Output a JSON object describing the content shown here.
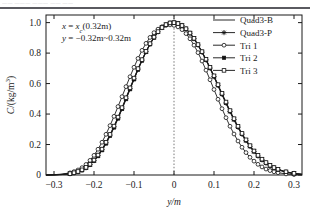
{
  "page": {
    "top_sliver_text": "—— ——— ——— ——  ——",
    "background": "#ffffff",
    "ink": "#1a1a1a"
  },
  "chart_data": {
    "type": "line",
    "title": "",
    "subtitle": "",
    "xlabel": "y/m",
    "ylabel": "C/(kg/m³)",
    "xlim": [
      -0.32,
      0.32
    ],
    "ylim": [
      0.0,
      1.05
    ],
    "xticks": [
      -0.3,
      -0.2,
      -0.1,
      0,
      0.1,
      0.2,
      0.3
    ],
    "xticklabels": [
      "−0.3",
      "−0.2",
      "−0.1",
      "0",
      "0.1",
      "0.2",
      "0.3"
    ],
    "yticks": [
      0.0,
      0.2,
      0.4,
      0.6,
      0.8,
      1.0
    ],
    "yticklabels": [
      "0",
      "0.2",
      "0.4",
      "0.6",
      "0.8",
      "1.0"
    ],
    "grid": false,
    "legend_position": "upper-right",
    "annotations": [
      {
        "id": "condition-x",
        "text_parts": {
          "var": "x",
          "eq": " = ",
          "sym": "x",
          "sub": "c",
          "rest": "(0.32m)"
        },
        "text": "x = xᶜ(0.32m)"
      },
      {
        "id": "condition-y",
        "text_parts": {
          "var": "y",
          "eq": " = ",
          "rest": "−0.32m~0.32m"
        },
        "text": "y = −0.32m~0.32m"
      }
    ],
    "reference_lines": [
      {
        "id": "vline-origin",
        "axis": "x",
        "value": 0,
        "style": "dotted"
      }
    ],
    "x": [
      -0.32,
      -0.3,
      -0.28,
      -0.26,
      -0.25,
      -0.24,
      -0.23,
      -0.22,
      -0.21,
      -0.2,
      -0.19,
      -0.18,
      -0.17,
      -0.16,
      -0.15,
      -0.14,
      -0.13,
      -0.12,
      -0.11,
      -0.1,
      -0.09,
      -0.08,
      -0.07,
      -0.06,
      -0.05,
      -0.04,
      -0.03,
      -0.02,
      -0.01,
      0.0,
      0.01,
      0.02,
      0.03,
      0.04,
      0.05,
      0.06,
      0.07,
      0.08,
      0.09,
      0.1,
      0.11,
      0.12,
      0.13,
      0.14,
      0.15,
      0.16,
      0.17,
      0.18,
      0.19,
      0.2,
      0.21,
      0.22,
      0.23,
      0.24,
      0.25,
      0.26,
      0.28,
      0.3,
      0.32
    ],
    "series": [
      {
        "name": "Quad3-B",
        "marker": "none",
        "line": "solid",
        "color": "#1a1a1a",
        "values": [
          0.0,
          0.001,
          0.003,
          0.008,
          0.013,
          0.02,
          0.031,
          0.046,
          0.066,
          0.092,
          0.124,
          0.162,
          0.206,
          0.256,
          0.311,
          0.37,
          0.432,
          0.497,
          0.562,
          0.627,
          0.69,
          0.75,
          0.806,
          0.857,
          0.901,
          0.938,
          0.966,
          0.986,
          0.997,
          1.0,
          0.994,
          0.98,
          0.958,
          0.929,
          0.893,
          0.851,
          0.804,
          0.753,
          0.699,
          0.642,
          0.584,
          0.526,
          0.469,
          0.413,
          0.36,
          0.31,
          0.264,
          0.222,
          0.184,
          0.151,
          0.122,
          0.097,
          0.076,
          0.059,
          0.045,
          0.034,
          0.018,
          0.009,
          0.004
        ]
      },
      {
        "name": "Quad3-P",
        "marker": "star",
        "line": "solid",
        "color": "#1a1a1a",
        "values": [
          0.0,
          0.001,
          0.004,
          0.009,
          0.014,
          0.022,
          0.033,
          0.048,
          0.069,
          0.095,
          0.128,
          0.167,
          0.212,
          0.262,
          0.317,
          0.376,
          0.438,
          0.503,
          0.568,
          0.632,
          0.695,
          0.754,
          0.81,
          0.86,
          0.904,
          0.94,
          0.968,
          0.987,
          0.998,
          1.0,
          0.994,
          0.981,
          0.959,
          0.93,
          0.895,
          0.853,
          0.806,
          0.756,
          0.702,
          0.646,
          0.588,
          0.53,
          0.473,
          0.417,
          0.364,
          0.314,
          0.268,
          0.226,
          0.188,
          0.154,
          0.125,
          0.1,
          0.078,
          0.061,
          0.047,
          0.035,
          0.019,
          0.01,
          0.004
        ]
      },
      {
        "name": "Tri 1",
        "marker": "open-circle",
        "line": "solid",
        "color": "#1a1a1a",
        "values": [
          0.0,
          0.002,
          0.006,
          0.014,
          0.022,
          0.033,
          0.048,
          0.069,
          0.096,
          0.129,
          0.169,
          0.215,
          0.267,
          0.324,
          0.385,
          0.449,
          0.514,
          0.58,
          0.645,
          0.707,
          0.765,
          0.818,
          0.864,
          0.903,
          0.934,
          0.957,
          0.973,
          0.982,
          0.985,
          0.982,
          0.972,
          0.954,
          0.928,
          0.894,
          0.852,
          0.803,
          0.748,
          0.688,
          0.625,
          0.561,
          0.497,
          0.435,
          0.376,
          0.32,
          0.269,
          0.223,
          0.182,
          0.147,
          0.116,
          0.091,
          0.07,
          0.053,
          0.039,
          0.029,
          0.021,
          0.015,
          0.007,
          0.003,
          0.001
        ]
      },
      {
        "name": "Tri 2",
        "marker": "filled-square",
        "line": "solid",
        "color": "#1a1a1a",
        "values": [
          0.0,
          0.001,
          0.003,
          0.008,
          0.013,
          0.02,
          0.031,
          0.046,
          0.066,
          0.092,
          0.124,
          0.163,
          0.207,
          0.257,
          0.312,
          0.371,
          0.433,
          0.498,
          0.563,
          0.628,
          0.691,
          0.751,
          0.807,
          0.858,
          0.902,
          0.939,
          0.967,
          0.986,
          0.997,
          1.0,
          0.995,
          0.981,
          0.959,
          0.931,
          0.895,
          0.854,
          0.807,
          0.757,
          0.703,
          0.647,
          0.589,
          0.531,
          0.474,
          0.418,
          0.365,
          0.315,
          0.269,
          0.227,
          0.189,
          0.155,
          0.126,
          0.101,
          0.079,
          0.062,
          0.048,
          0.036,
          0.02,
          0.01,
          0.004
        ]
      },
      {
        "name": "Tri 3",
        "marker": "open-square",
        "line": "solid",
        "color": "#1a1a1a",
        "values": [
          0.0,
          0.001,
          0.004,
          0.009,
          0.015,
          0.023,
          0.034,
          0.05,
          0.071,
          0.098,
          0.131,
          0.17,
          0.215,
          0.266,
          0.321,
          0.38,
          0.442,
          0.507,
          0.572,
          0.636,
          0.698,
          0.757,
          0.812,
          0.862,
          0.905,
          0.941,
          0.968,
          0.987,
          0.998,
          1.0,
          0.994,
          0.981,
          0.96,
          0.932,
          0.897,
          0.856,
          0.81,
          0.76,
          0.707,
          0.651,
          0.593,
          0.536,
          0.479,
          0.423,
          0.37,
          0.32,
          0.273,
          0.231,
          0.193,
          0.158,
          0.129,
          0.104,
          0.082,
          0.064,
          0.049,
          0.038,
          0.021,
          0.011,
          0.005
        ]
      }
    ]
  },
  "legend": {
    "entries": [
      {
        "label": "Quad3-B",
        "marker": "none"
      },
      {
        "label": "Quad3-P",
        "marker": "star"
      },
      {
        "label": "Tri 1",
        "marker": "open-circle"
      },
      {
        "label": "Tri 2",
        "marker": "filled-square"
      },
      {
        "label": "Tri 3",
        "marker": "open-square"
      }
    ]
  }
}
